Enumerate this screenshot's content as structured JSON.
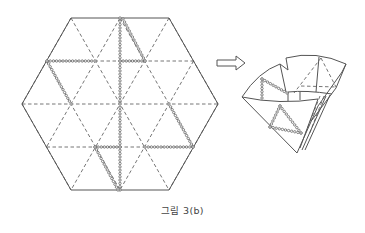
{
  "caption": "그림 3(b)",
  "diagram": {
    "left_figure": {
      "name": "hexagon-crease-pattern",
      "vertices": [
        [
          71,
          18
        ],
        [
          169,
          18
        ],
        [
          218,
          104
        ],
        [
          169,
          190
        ],
        [
          71,
          190
        ],
        [
          22,
          104
        ]
      ],
      "dashed_horizontal_y": [
        61,
        104,
        147
      ],
      "dotted_paths": [
        [
          [
            120,
            18
          ],
          [
            120,
            190
          ]
        ],
        [
          [
            123,
            19
          ],
          [
            145,
            61
          ],
          [
            120,
            61
          ]
        ],
        [
          [
            95,
            61
          ],
          [
            47,
            61
          ],
          [
            71,
            104
          ]
        ],
        [
          [
            169,
            104
          ],
          [
            193,
            147
          ],
          [
            145,
            147
          ]
        ],
        [
          [
            120,
            147
          ],
          [
            95,
            147
          ],
          [
            118,
            190
          ]
        ]
      ]
    },
    "arrow": {
      "direction": "right",
      "from": [
        216,
        63
      ],
      "to": [
        246,
        63
      ]
    },
    "right_figure": {
      "name": "folded-model",
      "dotted_paths": [
        [
          [
            287,
            93
          ],
          [
            262,
            79
          ],
          [
            262,
            98
          ]
        ],
        [
          [
            280,
            106
          ],
          [
            270,
            127
          ],
          [
            301,
            133
          ],
          [
            280,
            106
          ]
        ]
      ]
    }
  },
  "colors": {
    "line": "#555555",
    "background": "#ffffff",
    "text": "#444444"
  }
}
